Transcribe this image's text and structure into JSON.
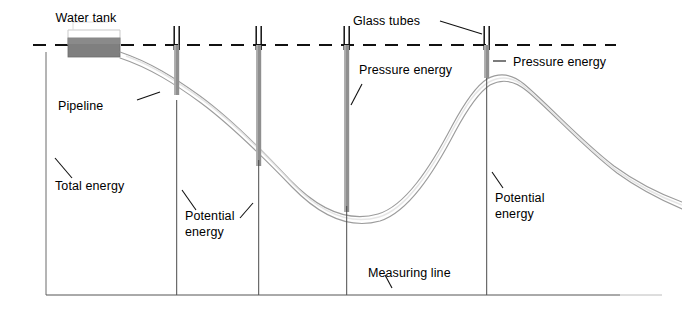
{
  "figure": {
    "kind": "hydraulic-grade-line-diagram",
    "background_color": "#ffffff",
    "line_color": "#1a1a1a",
    "tube_fill_color": "#8c8c8c",
    "tank_fill_color": "#7f7f7f",
    "pipeline_color": "#9a9a9a",
    "baseline_color": "#555555"
  },
  "labels": {
    "water_tank": "Water tank",
    "pipeline": "Pipeline",
    "glass_tubes": "Glass tubes",
    "total_energy": "Total energy",
    "measuring_line": "Measuring line",
    "pressure_energy_mid": "Pressure energy",
    "pressure_energy_right": "Pressure energy",
    "potential_energy_left_line1": "Potential",
    "potential_energy_left_line2": "energy",
    "potential_energy_right_line1": "Potential",
    "potential_energy_right_line2": "energy"
  },
  "elements": {
    "energy_line": {
      "name": "total-energy-line",
      "style": "dashed",
      "y": 45,
      "x_start": 33,
      "x_end": 616
    },
    "baseline": {
      "name": "datum-baseline",
      "y": 295,
      "x_start": 46,
      "x_end": 660
    },
    "water_tank": {
      "x": 68,
      "y": 38,
      "width": 52,
      "height": 19
    },
    "glass_tubes": [
      {
        "id": "tube-1",
        "x": 177,
        "water_top": 45,
        "water_bottom": 95,
        "stem_bottom": 295
      },
      {
        "id": "tube-2",
        "x": 259,
        "water_top": 45,
        "water_bottom": 166,
        "stem_bottom": 295
      },
      {
        "id": "tube-3",
        "x": 347,
        "water_top": 45,
        "water_bottom": 212,
        "stem_bottom": 295
      },
      {
        "id": "tube-4",
        "x": 487,
        "water_top": 45,
        "water_bottom": 78,
        "stem_bottom": 295
      }
    ],
    "measuring_lines": [
      {
        "id": "measuring-line-left",
        "x": 46,
        "y_top": 52,
        "y_bottom": 295
      }
    ]
  }
}
